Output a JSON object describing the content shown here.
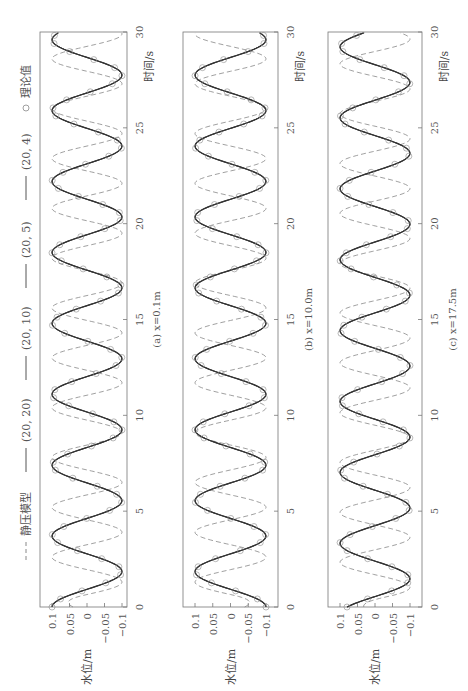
{
  "legend": {
    "items": [
      {
        "label": "静压模型",
        "style": "dashed"
      },
      {
        "label": "(20, 20)",
        "style": "solid"
      },
      {
        "label": "(20, 10)",
        "style": "solid"
      },
      {
        "label": "(20, 5)",
        "style": "solid"
      },
      {
        "label": "(20, 4)",
        "style": "solid"
      },
      {
        "label": "理论值",
        "style": "circle"
      }
    ]
  },
  "axes": {
    "xlabel": "时间/s",
    "ylabel": "水位/m",
    "xticks": [
      "0",
      "5",
      "10",
      "15",
      "20",
      "25",
      "30"
    ],
    "yticks": [
      "0.1",
      "0.05",
      "0",
      "−0.05",
      "−0.1"
    ]
  },
  "panels": [
    {
      "caption": "(a) x=0.1m"
    },
    {
      "caption": "(b) x=10.0m"
    },
    {
      "caption": "(c) x=17.5m"
    }
  ],
  "colors": {
    "nonhydrostatic": "#333333",
    "hydrostatic": "#888888",
    "theory": "#888888",
    "frame": "#777777"
  },
  "chart_data": [
    {
      "type": "line",
      "title": "(a) x=0.1m",
      "xlabel": "时间/s",
      "ylabel": "水位/m",
      "xlim": [
        0,
        30
      ],
      "ylim": [
        -0.12,
        0.12
      ],
      "xticks": [
        0,
        5,
        10,
        15,
        20,
        25,
        30
      ],
      "yticks": [
        0.1,
        0.05,
        0,
        -0.05,
        -0.1
      ],
      "series": [
        {
          "name": "静压模型",
          "style": "dashed",
          "amplitude": 0.1,
          "period_s": 2.6,
          "phase_at_t0": 0.1
        },
        {
          "name": "(20, 20)",
          "style": "solid",
          "amplitude": 0.1,
          "period_s": 3.7,
          "phase_at_t0": 0.1
        },
        {
          "name": "(20, 10)",
          "style": "solid",
          "amplitude": 0.1,
          "period_s": 3.7,
          "phase_at_t0": 0.1
        },
        {
          "name": "(20, 5)",
          "style": "solid",
          "amplitude": 0.1,
          "period_s": 3.7,
          "phase_at_t0": 0.1
        },
        {
          "name": "(20, 4)",
          "style": "solid",
          "amplitude": 0.1,
          "period_s": 3.7,
          "phase_at_t0": 0.1
        },
        {
          "name": "理论值",
          "style": "markers",
          "amplitude": 0.1,
          "period_s": 3.7,
          "phase_at_t0": 0.1
        }
      ]
    },
    {
      "type": "line",
      "title": "(b) x=10.0m",
      "xlabel": "时间/s",
      "ylabel": "水位/m",
      "xlim": [
        0,
        30
      ],
      "ylim": [
        -0.12,
        0.12
      ],
      "xticks": [
        0,
        5,
        10,
        15,
        20,
        25,
        30
      ],
      "yticks": [
        0.1,
        0.05,
        0,
        -0.05,
        -0.1
      ],
      "series": [
        {
          "name": "静压模型",
          "style": "dashed",
          "amplitude": 0.1,
          "period_s": 2.6,
          "phase_at_t0": -0.1
        },
        {
          "name": "(20, 20)",
          "style": "solid",
          "amplitude": 0.1,
          "period_s": 3.7,
          "phase_at_t0": -0.1
        },
        {
          "name": "(20, 10)",
          "style": "solid",
          "amplitude": 0.1,
          "period_s": 3.7,
          "phase_at_t0": -0.1
        },
        {
          "name": "(20, 5)",
          "style": "solid",
          "amplitude": 0.1,
          "period_s": 3.7,
          "phase_at_t0": -0.1
        },
        {
          "name": "(20, 4)",
          "style": "solid",
          "amplitude": 0.1,
          "period_s": 3.7,
          "phase_at_t0": -0.1
        },
        {
          "name": "理论值",
          "style": "markers",
          "amplitude": 0.1,
          "period_s": 3.7,
          "phase_at_t0": -0.1
        }
      ]
    },
    {
      "type": "line",
      "title": "(c) x=17.5m",
      "xlabel": "时间/s",
      "ylabel": "水位/m",
      "xlim": [
        0,
        30
      ],
      "ylim": [
        -0.12,
        0.12
      ],
      "xticks": [
        0,
        5,
        10,
        15,
        20,
        25,
        30
      ],
      "yticks": [
        0.1,
        0.05,
        0,
        -0.05,
        -0.1
      ],
      "series": [
        {
          "name": "静压模型",
          "style": "dashed",
          "amplitude": 0.1,
          "period_s": 2.6,
          "phase_at_t0": 0.08
        },
        {
          "name": "(20, 20)",
          "style": "solid",
          "amplitude": 0.1,
          "period_s": 3.7,
          "phase_at_t0": 0.08
        },
        {
          "name": "(20, 10)",
          "style": "solid",
          "amplitude": 0.1,
          "period_s": 3.7,
          "phase_at_t0": 0.08
        },
        {
          "name": "(20, 5)",
          "style": "solid",
          "amplitude": 0.1,
          "period_s": 3.7,
          "phase_at_t0": 0.08
        },
        {
          "name": "(20, 4)",
          "style": "solid",
          "amplitude": 0.1,
          "period_s": 3.7,
          "phase_at_t0": 0.08
        },
        {
          "name": "理论值",
          "style": "markers",
          "amplitude": 0.1,
          "period_s": 3.7,
          "phase_at_t0": 0.08
        }
      ]
    }
  ]
}
